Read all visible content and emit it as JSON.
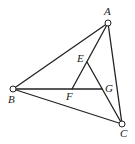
{
  "diagram": {
    "type": "geometry",
    "points": {
      "A": {
        "x": 108,
        "y": 23,
        "label": "A",
        "lx": 104,
        "ly": 15,
        "vertex": true
      },
      "B": {
        "x": 13,
        "y": 89,
        "label": "B",
        "lx": 8,
        "ly": 103,
        "vertex": true
      },
      "C": {
        "x": 122,
        "y": 124,
        "label": "C",
        "lx": 120,
        "ly": 137,
        "vertex": true
      },
      "E": {
        "x": 87,
        "y": 62,
        "label": "E",
        "lx": 77,
        "ly": 62,
        "vertex": false
      },
      "F": {
        "x": 72,
        "y": 89,
        "label": "F",
        "lx": 66,
        "ly": 100,
        "vertex": false
      },
      "G": {
        "x": 102,
        "y": 89,
        "label": "G",
        "lx": 105,
        "ly": 92,
        "vertex": false
      }
    },
    "segments": [
      [
        "A",
        "B"
      ],
      [
        "A",
        "C"
      ],
      [
        "B",
        "C"
      ],
      [
        "B",
        "G"
      ],
      [
        "A",
        "F"
      ],
      [
        "E",
        "C"
      ]
    ]
  }
}
